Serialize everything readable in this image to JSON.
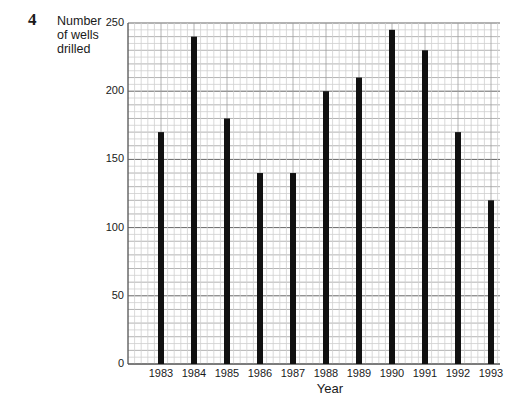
{
  "question_number": "4",
  "chart_data": {
    "type": "bar",
    "title": "",
    "xlabel": "Year",
    "ylabel": "Number of wells drilled",
    "ylabel_lines": [
      "Number",
      "of wells",
      "drilled"
    ],
    "categories": [
      "1983",
      "1984",
      "1985",
      "1986",
      "1987",
      "1988",
      "1989",
      "1990",
      "1991",
      "1992",
      "1993"
    ],
    "values": [
      170,
      240,
      180,
      140,
      140,
      200,
      210,
      245,
      230,
      170,
      120
    ],
    "ylim": [
      0,
      250
    ],
    "yticks": [
      0,
      50,
      100,
      150,
      200,
      250
    ],
    "grid": true,
    "grid_major_step": 10,
    "grid_minor_step": 5,
    "legend": null,
    "bar_color": "#111111",
    "grid_color": "#9a9a9a"
  }
}
